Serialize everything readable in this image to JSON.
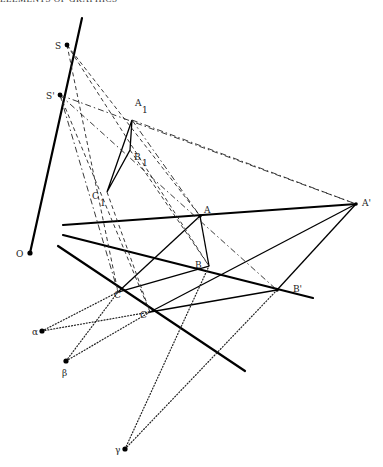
{
  "header": {
    "text": "ELEMENTS OF GRAPHICS"
  },
  "labels": {
    "S": "S",
    "S_prime": "S'",
    "O": "O",
    "A1": "A",
    "A1_sub": "1",
    "B1": "B",
    "B1_sub": "1",
    "C1": "C",
    "C1_sub": "1",
    "A": "A",
    "B": "B",
    "C": "C",
    "C_prime": "C'",
    "A_prime": "A'",
    "B_prime": "B'",
    "alpha": "α",
    "beta": "β",
    "gamma": "γ"
  },
  "points": {
    "O": [
      30,
      253
    ],
    "S": [
      67,
      45
    ],
    "S_prime": [
      60,
      95
    ],
    "A1": [
      132,
      120
    ],
    "B1": [
      130,
      150
    ],
    "C1": [
      107,
      192
    ],
    "A": [
      200,
      216
    ],
    "B": [
      209,
      266
    ],
    "C": [
      118,
      292
    ],
    "C_prime": [
      150,
      312
    ],
    "A_prime": [
      356,
      204
    ],
    "B_prime": [
      277,
      290
    ],
    "alpha": [
      42,
      331
    ],
    "beta": [
      66,
      361
    ],
    "gamma": [
      125,
      449
    ]
  }
}
